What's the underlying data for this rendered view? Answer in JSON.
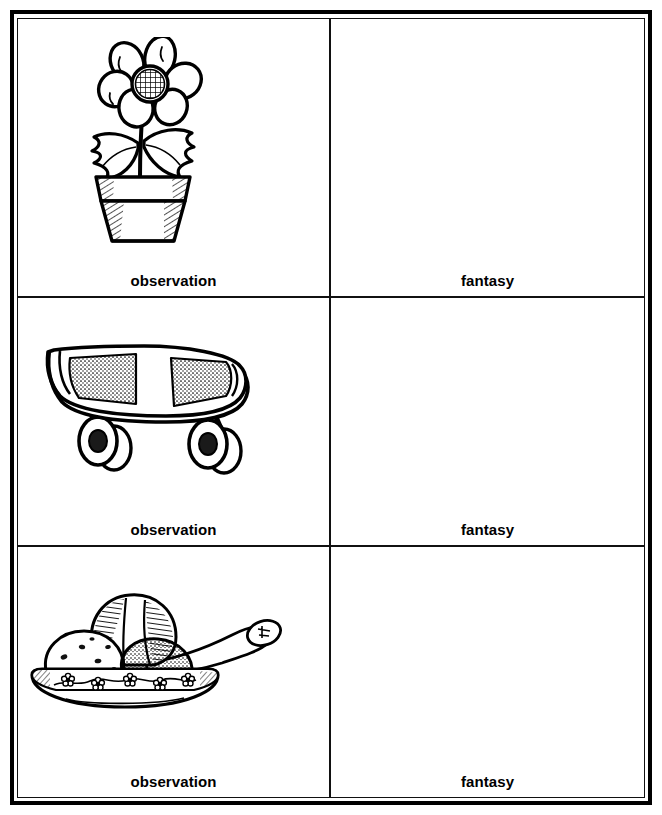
{
  "worksheet": {
    "title": "Observation and Fantasy Drawing Worksheet",
    "columns": [
      "observation",
      "fantasy"
    ],
    "rows": [
      {
        "id": "row-flower",
        "observation": {
          "label": "observation",
          "illustration": "potted-flower-illustration",
          "description": "Line drawing of a flower with six oval petals and a crosshatched center, two serrated leaves, growing in a terracotta pot with hatched shading"
        },
        "fantasy": {
          "label": "fantasy",
          "illustration": "",
          "description": "Empty drawing area"
        }
      },
      {
        "id": "row-skateboard",
        "observation": {
          "label": "observation",
          "illustration": "skateboard-illustration",
          "description": "Line drawing of a skateboard in three-quarter view with an upturned nose, two stippled grip-tape patches and two wheels"
        },
        "fantasy": {
          "label": "fantasy",
          "illustration": "",
          "description": "Empty drawing area"
        }
      },
      {
        "id": "row-icecream",
        "observation": {
          "label": "observation",
          "illustration": "ice-cream-bowl-illustration",
          "description": "Line drawing of a decorated bowl with a flower border holding three scoops of ice cream with a spoon resting on the rim"
        },
        "fantasy": {
          "label": "fantasy",
          "illustration": "",
          "description": "Empty drawing area"
        }
      }
    ]
  },
  "colors": {
    "ink": "#000000",
    "paper": "#ffffff",
    "rule": "#111111"
  }
}
